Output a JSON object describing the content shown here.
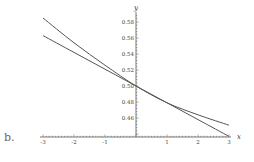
{
  "panel_label": "b.",
  "chart_data": {
    "type": "line",
    "title": "",
    "xlabel": "x",
    "ylabel": "y",
    "xlim": [
      -3,
      3
    ],
    "ylim": [
      0.44,
      0.59
    ],
    "x_ticks": [
      -3,
      -2,
      -1,
      1,
      2,
      3
    ],
    "x_tick_labels": [
      "-3",
      "-2",
      "-1",
      "1",
      "2",
      "3"
    ],
    "y_ticks": [
      0.46,
      0.48,
      0.5,
      0.52,
      0.54,
      0.56,
      0.58
    ],
    "y_tick_labels": [
      "0.46",
      "0.48",
      "0.50",
      "0.52",
      "0.54",
      "0.56",
      "0.58"
    ],
    "grid": false,
    "legend": null,
    "x": [
      -3,
      -2,
      -1,
      0,
      1,
      2,
      3
    ],
    "series": [
      {
        "name": "curve",
        "values": [
          0.585,
          0.554,
          0.526,
          0.5,
          0.479,
          0.464,
          0.451
        ]
      },
      {
        "name": "tangent-line",
        "values": [
          0.563,
          0.542,
          0.521,
          0.5,
          0.479,
          0.458,
          0.437
        ]
      }
    ],
    "line_color": "#555555",
    "axis_color": "#555555"
  }
}
